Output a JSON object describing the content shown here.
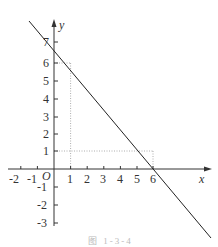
{
  "diagram": {
    "type": "coordinate-plane-line-graph",
    "axes": {
      "x_label": "x",
      "y_label": "y",
      "origin_label": "O",
      "x_ticks": [
        "-2",
        "-1",
        "1",
        "2",
        "3",
        "4",
        "5",
        "6"
      ],
      "y_ticks": [
        "7",
        "6",
        "5",
        "4",
        "3",
        "2",
        "1",
        "-1",
        "-2",
        "-3"
      ]
    },
    "line": {
      "equation": "y = -x + 7",
      "slope": -1,
      "intercept": 7
    },
    "guides": [
      {
        "point": [
          1,
          6
        ],
        "style": "dotted"
      },
      {
        "point": [
          6,
          1
        ],
        "style": "dotted"
      }
    ],
    "caption": "图 1-3-4"
  }
}
